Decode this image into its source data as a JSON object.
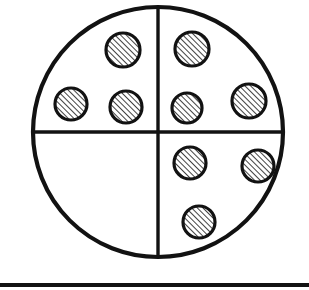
{
  "figure": {
    "type": "line-drawing",
    "canvas": {
      "width": 309,
      "height": 290,
      "background": "#ffffff"
    },
    "ink_color": "#121212",
    "fill_color": "#ffffff",
    "hatch": {
      "name": "diagonal-hatch",
      "angle_deg": 45,
      "spacing_px": 4,
      "stroke_width_px": 1.6,
      "color": "#121212"
    },
    "outer_circle": {
      "name": "outer-circle",
      "cx": 158,
      "cy": 132,
      "r": 125,
      "stroke_width_px": 4.2
    },
    "divider_vertical": {
      "name": "vertical-divider",
      "x": 158,
      "y1": 7,
      "y2": 257,
      "stroke_width_px": 3.4
    },
    "divider_horizontal": {
      "name": "horizontal-divider",
      "y": 132,
      "x1": 33,
      "x2": 283,
      "stroke_width_px": 3.4
    },
    "baseline_bar": {
      "name": "baseline-bar",
      "x": 0,
      "y": 283,
      "width": 309,
      "height": 4,
      "color": "#121212"
    },
    "quadrants": [
      {
        "name": "top-left-quadrant",
        "label": "upper-left",
        "dot_count": 3
      },
      {
        "name": "top-right-quadrant",
        "label": "upper-right",
        "dot_count": 3
      },
      {
        "name": "bottom-right-quadrant",
        "label": "lower-right",
        "dot_count": 3
      },
      {
        "name": "bottom-left-quadrant",
        "label": "lower-left",
        "dot_count": 0
      }
    ],
    "dots": [
      {
        "id": "dot-tl-1",
        "quadrant": "top-left",
        "cx": 123,
        "cy": 50,
        "r": 17
      },
      {
        "id": "dot-tl-2",
        "quadrant": "top-left",
        "cx": 71,
        "cy": 104,
        "r": 16
      },
      {
        "id": "dot-tl-3",
        "quadrant": "top-left",
        "cx": 126,
        "cy": 107,
        "r": 16
      },
      {
        "id": "dot-tr-1",
        "quadrant": "top-right",
        "cx": 192,
        "cy": 49,
        "r": 17
      },
      {
        "id": "dot-tr-2",
        "quadrant": "top-right",
        "cx": 187,
        "cy": 108,
        "r": 15
      },
      {
        "id": "dot-tr-3",
        "quadrant": "top-right",
        "cx": 249,
        "cy": 101,
        "r": 17
      },
      {
        "id": "dot-br-1",
        "quadrant": "bottom-right",
        "cx": 190,
        "cy": 163,
        "r": 16
      },
      {
        "id": "dot-br-2",
        "quadrant": "bottom-right",
        "cx": 258,
        "cy": 166,
        "r": 16
      },
      {
        "id": "dot-br-3",
        "quadrant": "bottom-right",
        "cx": 199,
        "cy": 222,
        "r": 16
      }
    ],
    "totals": {
      "dot_count": 9,
      "empty_quadrants": 1
    }
  }
}
